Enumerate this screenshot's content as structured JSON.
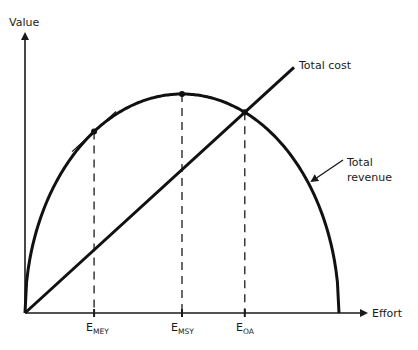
{
  "chart_data": {
    "type": "line",
    "title": "",
    "xlabel": "Effort",
    "ylabel": "Value",
    "x_range": [
      0,
      1
    ],
    "y_range": [
      0,
      1
    ],
    "series": [
      {
        "name": "Total revenue",
        "shape": "semi-ellipse",
        "points": [
          [
            0,
            0
          ],
          [
            0.5,
            1.0
          ],
          [
            1.0,
            0
          ]
        ]
      },
      {
        "name": "Total cost",
        "shape": "straight-line",
        "points": [
          [
            0,
            0
          ],
          [
            0.87,
            1.12
          ]
        ]
      }
    ],
    "markers": [
      {
        "name": "E_MEY",
        "main": "E",
        "sub": "MEY",
        "x": 0.22,
        "note": "tangent to revenue parallel to cost"
      },
      {
        "name": "E_MSY",
        "main": "E",
        "sub": "MSY",
        "x": 0.5,
        "note": "revenue maximum"
      },
      {
        "name": "E_OA",
        "main": "E",
        "sub": "OA",
        "x": 0.7,
        "note": "revenue equals cost"
      }
    ],
    "annotations": [
      {
        "text": "Total cost",
        "target": "Total cost"
      },
      {
        "text": [
          "Total",
          "revenue"
        ],
        "target": "Total revenue",
        "arrow": true
      }
    ],
    "grid": false,
    "legend": "none"
  },
  "labels": {
    "value": "Value",
    "effort": "Effort",
    "total_cost": "Total cost",
    "total_revenue_1": "Total",
    "total_revenue_2": "revenue",
    "e": "E",
    "mey": "MEY",
    "msy": "MSY",
    "oa": "OA"
  }
}
